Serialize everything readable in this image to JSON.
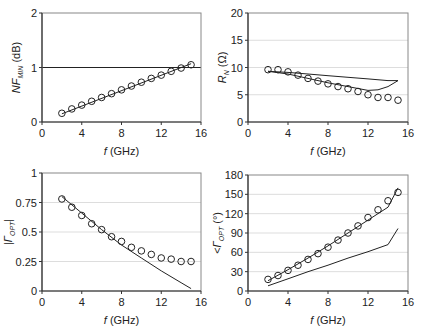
{
  "chart_data": [
    {
      "id": "nfmin",
      "type": "scatter",
      "title": "",
      "xlabel": "f (GHz)",
      "ylabel": "NF_MIN (dB)",
      "ylabel_parts": {
        "main": "NF",
        "sub": "MIN",
        "unit": " (dB)"
      },
      "xlim": [
        0,
        16
      ],
      "ylim": [
        0,
        2
      ],
      "xticks": [
        0,
        4,
        8,
        12,
        16
      ],
      "yticks": [
        0,
        1,
        2
      ],
      "ytick_labels": [
        "0",
        "1",
        "2"
      ],
      "grid": "horizontal",
      "reference_line": 1,
      "box": {
        "x0": 42,
        "x1": 201,
        "y0": 122,
        "y1": 13
      },
      "series": [
        {
          "name": "measured",
          "style": "markers",
          "x": [
            2,
            3,
            4,
            5,
            6,
            7,
            8,
            9,
            10,
            11,
            12,
            13,
            14,
            15
          ],
          "y": [
            0.16,
            0.24,
            0.31,
            0.38,
            0.45,
            0.52,
            0.59,
            0.66,
            0.73,
            0.8,
            0.86,
            0.93,
            0.99,
            1.05
          ]
        },
        {
          "name": "model",
          "style": "line",
          "x": [
            2,
            15
          ],
          "y": [
            0.15,
            1.07
          ]
        }
      ]
    },
    {
      "id": "rn",
      "type": "scatter",
      "title": "",
      "xlabel": "f (GHz)",
      "ylabel": "R_N (Ω)",
      "ylabel_parts": {
        "main": "R",
        "sub": "N",
        "unit": " (Ω)"
      },
      "xlim": [
        0,
        16
      ],
      "ylim": [
        0,
        20
      ],
      "xticks": [
        0,
        4,
        8,
        12,
        16
      ],
      "yticks": [
        0,
        5,
        10,
        15,
        20
      ],
      "ytick_labels": [
        "0",
        "5",
        "10",
        "15",
        "20"
      ],
      "grid": "horizontal",
      "box": {
        "x0": 248,
        "x1": 408,
        "y0": 122,
        "y1": 13
      },
      "series": [
        {
          "name": "measured",
          "style": "markers",
          "x": [
            2,
            3,
            4,
            5,
            6,
            7,
            8,
            9,
            10,
            11,
            12,
            13,
            14,
            15
          ],
          "y": [
            9.6,
            9.6,
            9.2,
            8.6,
            8.0,
            7.5,
            7.0,
            6.5,
            6.1,
            5.6,
            5.0,
            4.5,
            4.5,
            4.0
          ]
        },
        {
          "name": "model-upper",
          "style": "line",
          "x": [
            2,
            4,
            6,
            8,
            10,
            12,
            14,
            15
          ],
          "y": [
            9.3,
            9.1,
            8.8,
            8.5,
            8.2,
            7.9,
            7.6,
            7.6
          ]
        },
        {
          "name": "model-lower",
          "style": "line",
          "x": [
            2,
            4,
            6,
            8,
            10,
            12,
            13,
            14,
            15
          ],
          "y": [
            9.3,
            8.8,
            8.0,
            7.2,
            6.5,
            5.8,
            5.9,
            6.5,
            7.6
          ]
        }
      ]
    },
    {
      "id": "gamma-mag",
      "type": "scatter",
      "title": "",
      "xlabel": "f (GHz)",
      "ylabel": "|Γ_OPT|",
      "ylabel_parts": {
        "main": "|Γ",
        "sub": "OPT",
        "unit": "|"
      },
      "xlim": [
        0,
        16
      ],
      "ylim": [
        0,
        1
      ],
      "xticks": [
        0,
        4,
        8,
        12,
        16
      ],
      "yticks": [
        0,
        0.25,
        0.5,
        0.75,
        1
      ],
      "ytick_labels": [
        "0",
        "0.25",
        "0.5",
        "0.75",
        "1"
      ],
      "grid": "horizontal",
      "box": {
        "x0": 42,
        "x1": 201,
        "y0": 291,
        "y1": 173
      },
      "series": [
        {
          "name": "measured",
          "style": "markers",
          "x": [
            2,
            3,
            4,
            5,
            6,
            7,
            8,
            9,
            10,
            11,
            12,
            13,
            14,
            15
          ],
          "y": [
            0.78,
            0.71,
            0.64,
            0.57,
            0.52,
            0.46,
            0.42,
            0.37,
            0.34,
            0.31,
            0.28,
            0.27,
            0.25,
            0.25
          ]
        },
        {
          "name": "model",
          "style": "line",
          "x": [
            2,
            4,
            6,
            8,
            10,
            12,
            14,
            15
          ],
          "y": [
            0.8,
            0.66,
            0.52,
            0.39,
            0.28,
            0.17,
            0.07,
            0.02
          ]
        }
      ]
    },
    {
      "id": "gamma-angle",
      "type": "scatter",
      "title": "",
      "xlabel": "f (GHz)",
      "ylabel": "<Γ_OPT (°)",
      "ylabel_parts": {
        "main": "<Γ",
        "sub": "OPT",
        "unit": " (°)"
      },
      "xlim": [
        0,
        16
      ],
      "ylim": [
        0,
        180
      ],
      "xticks": [
        0,
        4,
        8,
        12,
        16
      ],
      "yticks": [
        0,
        30,
        60,
        90,
        120,
        150,
        180
      ],
      "ytick_labels": [
        "0",
        "30",
        "60",
        "90",
        "120",
        "150",
        "180"
      ],
      "grid": "horizontal",
      "box": {
        "x0": 248,
        "x1": 408,
        "y0": 291,
        "y1": 175
      },
      "series": [
        {
          "name": "measured",
          "style": "markers",
          "x": [
            2,
            3,
            4,
            5,
            6,
            7,
            8,
            9,
            10,
            11,
            12,
            13,
            14,
            15
          ],
          "y": [
            18,
            24,
            32,
            40,
            49,
            58,
            68,
            79,
            90,
            101,
            114,
            126,
            140,
            153
          ]
        },
        {
          "name": "model-upper",
          "style": "line",
          "x": [
            2,
            4,
            6,
            8,
            10,
            12,
            14,
            15
          ],
          "y": [
            16,
            33,
            51,
            70,
            90,
            110,
            130,
            160
          ]
        },
        {
          "name": "model-lower",
          "style": "line",
          "x": [
            2,
            4,
            6,
            8,
            10,
            12,
            14,
            15
          ],
          "y": [
            8,
            19,
            30,
            40,
            51,
            61,
            72,
            97
          ]
        }
      ]
    }
  ],
  "colors": {
    "axis": "#333333",
    "grid": "#dddddd",
    "line": "#222222",
    "marker": "#222222",
    "background": "#ffffff"
  }
}
